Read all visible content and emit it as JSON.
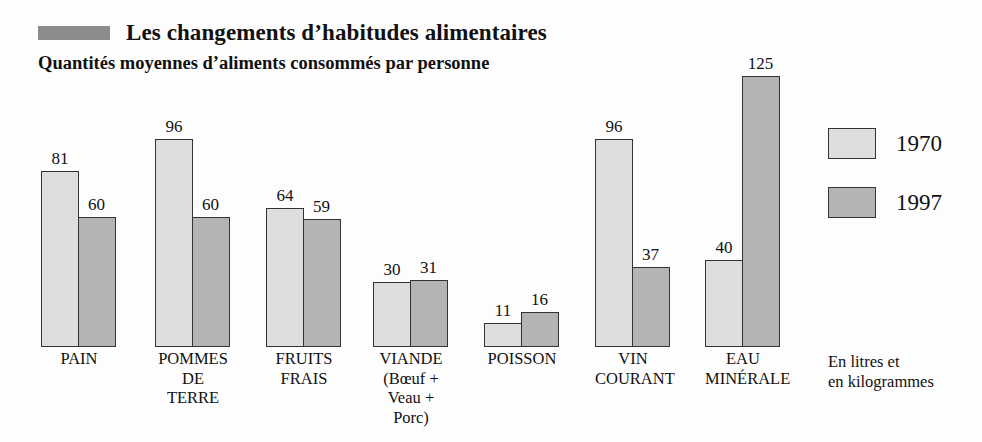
{
  "header": {
    "title": "Les changements d’habitudes alimentaires",
    "subtitle": "Quantités moyennes d’aliments consommés par personne",
    "marker_icon": "square-marker-icon"
  },
  "legend": {
    "position": "right",
    "entries": [
      {
        "label": "1970",
        "color": "#dedede"
      },
      {
        "label": "1997",
        "color": "#b4b4b4"
      }
    ]
  },
  "footnote": {
    "line1": "En litres et",
    "line2": "en kilogrammes"
  },
  "chart_data": {
    "type": "bar",
    "title": "Les changements d’habitudes alimentaires",
    "subtitle": "Quantités moyennes d’aliments consommés par personne",
    "xlabel": "",
    "ylabel": "En litres et en kilogrammes",
    "ylim": [
      0,
      125
    ],
    "grid": false,
    "legend_position": "right",
    "categories": [
      "PAIN",
      "POMMES DE TERRE",
      "FRUITS FRAIS",
      "VIANDE (Bœuf + Veau + Porc)",
      "POISSON",
      "VIN COURANT",
      "EAU MINÉRALE"
    ],
    "category_label_lines": [
      [
        "PAIN"
      ],
      [
        "POMMES",
        "DE",
        "TERRE"
      ],
      [
        "FRUITS",
        "FRAIS"
      ],
      [
        "VIANDE",
        "(Bœuf +",
        "Veau +",
        "Porc)"
      ],
      [
        "POISSON"
      ],
      [
        "VIN",
        "COURANT"
      ],
      [
        "EAU",
        "MINÉRALE"
      ]
    ],
    "series": [
      {
        "name": "1970",
        "color": "#dedede",
        "values": [
          81,
          96,
          64,
          30,
          11,
          96,
          40
        ]
      },
      {
        "name": "1997",
        "color": "#b4b4b4",
        "values": [
          60,
          60,
          59,
          31,
          16,
          37,
          125
        ]
      }
    ]
  },
  "layout": {
    "group_left_px": [
      41,
      155,
      266,
      373,
      484,
      595,
      705
    ],
    "baseline_y_px": 347,
    "px_per_unit": 2.17,
    "bar_width_px": 38
  }
}
